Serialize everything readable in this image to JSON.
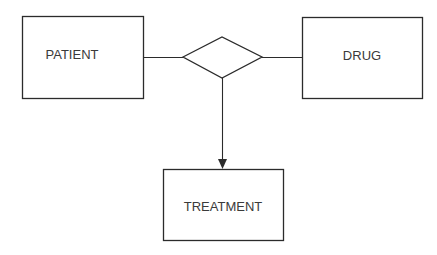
{
  "diagram": {
    "type": "entity-relationship",
    "entities": [
      {
        "id": "patient",
        "label": "PATIENT"
      },
      {
        "id": "drug",
        "label": "DRUG"
      },
      {
        "id": "treatment",
        "label": "TREATMENT"
      }
    ],
    "relationship": {
      "shape": "diamond",
      "label": ""
    },
    "edges": [
      {
        "from": "patient",
        "to": "relationship",
        "style": "line"
      },
      {
        "from": "relationship",
        "to": "drug",
        "style": "line"
      },
      {
        "from": "relationship",
        "to": "treatment",
        "style": "arrow"
      }
    ],
    "colors": {
      "stroke": "#2b2b2b",
      "text": "#3a3a3a",
      "background": "#ffffff"
    }
  }
}
